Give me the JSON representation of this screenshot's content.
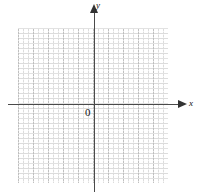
{
  "figure": {
    "title": "",
    "type": "coordinate-plane"
  },
  "axes": {
    "x_label": "x",
    "y_label": "y",
    "origin_label": "0"
  },
  "colors": {
    "axis": "#4a4a4a",
    "arrow": "#333333",
    "grid_major": "#bfbfbf",
    "grid_minor": "#dcdcdc",
    "background": "#ffffff",
    "text": "#111111"
  },
  "chart_data": {
    "type": "scatter",
    "title": "",
    "xlabel": "x",
    "ylabel": "y",
    "x": [],
    "y": [],
    "series": [],
    "annotations": [
      "0"
    ],
    "xlim": [
      -5,
      5
    ],
    "ylim": [
      -6,
      5
    ],
    "grid": true,
    "grid_major_step": 1,
    "grid_minor_step": 0.3333,
    "legend": "none"
  }
}
